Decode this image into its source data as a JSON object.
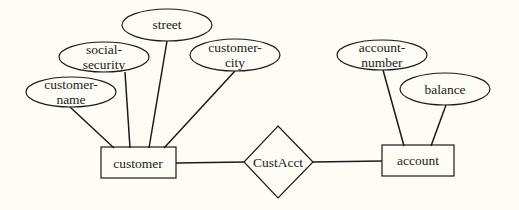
{
  "diagram": {
    "type": "entity-relationship",
    "colors": {
      "background": "#fdfdf6",
      "stroke": "#1a1a1a",
      "text": "#222222"
    },
    "entities": [
      {
        "id": "customer",
        "label": "customer",
        "x": 101,
        "y": 147,
        "w": 75,
        "h": 31
      },
      {
        "id": "account",
        "label": "account",
        "x": 382,
        "y": 145,
        "w": 72,
        "h": 31
      }
    ],
    "relationships": [
      {
        "id": "custacct",
        "label": "CustAcct",
        "cx": 278,
        "cy": 162,
        "hw": 34,
        "hh": 36
      }
    ],
    "attributes": [
      {
        "id": "customer-name",
        "line1": "customer-",
        "line2": "name",
        "cx": 71,
        "cy": 92,
        "rx": 45,
        "ry": 15,
        "entity": "customer"
      },
      {
        "id": "social-security",
        "line1": "social-",
        "line2": "security",
        "cx": 104,
        "cy": 57,
        "rx": 45,
        "ry": 15,
        "entity": "customer"
      },
      {
        "id": "street",
        "line1": "street",
        "line2": "",
        "cx": 167,
        "cy": 25,
        "rx": 45,
        "ry": 16,
        "entity": "customer"
      },
      {
        "id": "customer-city",
        "line1": "customer-",
        "line2": "city",
        "cx": 235,
        "cy": 55,
        "rx": 45,
        "ry": 16,
        "entity": "customer"
      },
      {
        "id": "account-number",
        "line1": "account-",
        "line2": "number",
        "cx": 382,
        "cy": 55,
        "rx": 45,
        "ry": 15,
        "entity": "account"
      },
      {
        "id": "balance",
        "line1": "balance",
        "line2": "",
        "cx": 445,
        "cy": 89,
        "rx": 45,
        "ry": 16,
        "entity": "account"
      }
    ],
    "edges": [
      {
        "from": "customer-name",
        "to": "customer",
        "x1": 70,
        "y1": 107,
        "x2": 114,
        "y2": 148
      },
      {
        "from": "social-security",
        "to": "customer",
        "x1": 125,
        "y1": 72,
        "x2": 130,
        "y2": 148
      },
      {
        "from": "street",
        "to": "customer",
        "x1": 167,
        "y1": 41,
        "x2": 149,
        "y2": 148
      },
      {
        "from": "customer-city",
        "to": "customer",
        "x1": 235,
        "y1": 71,
        "x2": 164,
        "y2": 148
      },
      {
        "from": "customer",
        "to": "custacct",
        "x1": 176,
        "y1": 163,
        "x2": 244,
        "y2": 162
      },
      {
        "from": "custacct",
        "to": "account",
        "x1": 313,
        "y1": 162,
        "x2": 382,
        "y2": 161
      },
      {
        "from": "account-number",
        "to": "account",
        "x1": 383,
        "y1": 70,
        "x2": 404,
        "y2": 146
      },
      {
        "from": "balance",
        "to": "account",
        "x1": 446,
        "y1": 105,
        "x2": 431,
        "y2": 146
      }
    ]
  },
  "labels": {
    "customer": "customer",
    "account": "account",
    "custacct": "CustAcct",
    "customer_name_1": "customer-",
    "customer_name_2": "name",
    "social_security_1": "social-",
    "social_security_2": "security",
    "street": "street",
    "customer_city_1": "customer-",
    "customer_city_2": "city",
    "account_number_1": "account-",
    "account_number_2": "number",
    "balance": "balance"
  }
}
